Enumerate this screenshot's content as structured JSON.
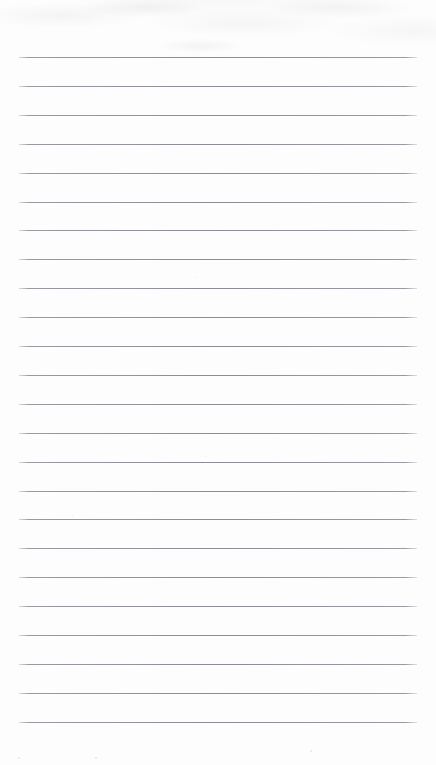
{
  "document": {
    "kind": "scanned-lined-paper",
    "title": "Blank Ruled Notepad Page",
    "page_width": 436,
    "page_height": 765,
    "background_color": "#fdfdfd",
    "has_visible_text": false,
    "written_content": "",
    "top_margin_px": 57,
    "bottom_margin_px": 43
  },
  "ruling": {
    "line_color": "#8a8e94",
    "line_thickness_px": 1,
    "line_left_px": 19,
    "line_right_px": 417,
    "line_width_px": 398,
    "first_line_y_px": 57,
    "last_line_y_px": 722,
    "line_spacing_px": 28.9,
    "line_count": 24,
    "line_y_positions": [
      57,
      85.9,
      114.8,
      143.7,
      172.6,
      201.5,
      230.4,
      259.3,
      288.2,
      317.1,
      346,
      374.9,
      403.8,
      432.7,
      461.6,
      490.5,
      519.4,
      548.3,
      577.2,
      606.1,
      635,
      663.9,
      692.8,
      721.7
    ]
  },
  "artifacts": {
    "grain_color": "#a0a4a8",
    "grain_region": "top-edge",
    "specks": [
      {
        "x": 310,
        "y": 750,
        "size": 2
      },
      {
        "x": 18,
        "y": 757,
        "size": 2
      },
      {
        "x": 95,
        "y": 757,
        "size": 2
      },
      {
        "x": 205,
        "y": 456,
        "size": 1
      },
      {
        "x": 72,
        "y": 515,
        "size": 1
      },
      {
        "x": 196,
        "y": 277,
        "size": 1
      }
    ]
  }
}
